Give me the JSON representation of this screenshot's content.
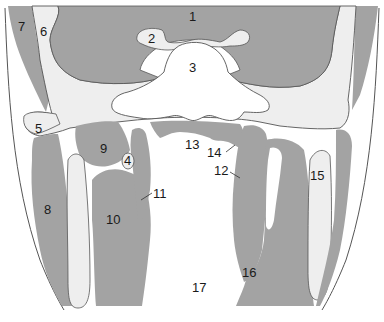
{
  "diagram": {
    "type": "anatomical cross-section",
    "colors": {
      "background": "#ffffff",
      "muscle_gray": "#a3a3a3",
      "pale_tissue": "#eeeeee",
      "bone_white": "#ffffff",
      "outline": "#555555"
    },
    "labels": [
      {
        "id": "1",
        "text": "1",
        "x": 193,
        "y": 20
      },
      {
        "id": "2",
        "text": "2",
        "x": 152,
        "y": 42
      },
      {
        "id": "3",
        "text": "3",
        "x": 193,
        "y": 71
      },
      {
        "id": "4",
        "text": "4",
        "x": 129,
        "y": 162
      },
      {
        "id": "5",
        "text": "5",
        "x": 39,
        "y": 132
      },
      {
        "id": "6",
        "text": "6",
        "x": 44,
        "y": 35
      },
      {
        "id": "7",
        "text": "7",
        "x": 22,
        "y": 30
      },
      {
        "id": "8",
        "text": "8",
        "x": 48,
        "y": 213
      },
      {
        "id": "9",
        "text": "9",
        "x": 104,
        "y": 152
      },
      {
        "id": "10",
        "text": "10",
        "x": 113,
        "y": 223
      },
      {
        "id": "11",
        "text": "11",
        "x": 161,
        "y": 197
      },
      {
        "id": "12",
        "text": "12",
        "x": 222,
        "y": 175
      },
      {
        "id": "13",
        "text": "13",
        "x": 193,
        "y": 148
      },
      {
        "id": "14",
        "text": "14",
        "x": 213,
        "y": 155
      },
      {
        "id": "15",
        "text": "15",
        "x": 318,
        "y": 180
      },
      {
        "id": "16",
        "text": "16",
        "x": 250,
        "y": 277
      },
      {
        "id": "17",
        "text": "17",
        "x": 200,
        "y": 291
      }
    ]
  }
}
